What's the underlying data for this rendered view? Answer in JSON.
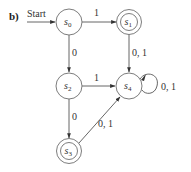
{
  "figure": {
    "part_label": "b)",
    "start_label": "Start"
  },
  "states": [
    {
      "id": "s0",
      "name": "s",
      "sub": "0",
      "accepting": false
    },
    {
      "id": "s1",
      "name": "s",
      "sub": "1",
      "accepting": true
    },
    {
      "id": "s2",
      "name": "s",
      "sub": "2",
      "accepting": false
    },
    {
      "id": "s3",
      "name": "s",
      "sub": "3",
      "accepting": true
    },
    {
      "id": "s4",
      "name": "s",
      "sub": "4",
      "accepting": false
    }
  ],
  "transitions": [
    {
      "from": "s0",
      "to": "s1",
      "label": "1"
    },
    {
      "from": "s0",
      "to": "s2",
      "label": "0"
    },
    {
      "from": "s1",
      "to": "s4",
      "label": "0, 1"
    },
    {
      "from": "s2",
      "to": "s4",
      "label": "1"
    },
    {
      "from": "s2",
      "to": "s3",
      "label": "0"
    },
    {
      "from": "s3",
      "to": "s4",
      "label": "0, 1"
    },
    {
      "from": "s4",
      "to": "s4",
      "label": "0, 1"
    }
  ],
  "start_state": "s0",
  "colors": {
    "stroke": "#6e6e6e",
    "text": "#333333"
  }
}
